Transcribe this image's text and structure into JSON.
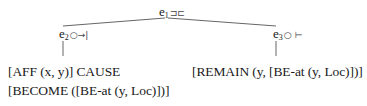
{
  "diagram": {
    "type": "event-structure-tree",
    "root": {
      "label": "e",
      "index": "1",
      "symbol": "⊐⊏",
      "symbol_name": "overlap-icon"
    },
    "children": [
      {
        "label": "e",
        "index": "2",
        "symbol": "○→|",
        "symbol_name": "bounded-process-icon",
        "formula_lines": [
          "[AFF (x, y)] CAUSE",
          "[BECOME ([BE-at (y, Loc)])]"
        ]
      },
      {
        "label": "e",
        "index": "3",
        "symbol": "○ ⊢",
        "symbol_name": "onset-state-icon",
        "formula_lines": [
          "[REMAIN (y, [BE-at (y, Loc)])]"
        ]
      }
    ],
    "colors": {
      "text": "#1a1a1a",
      "lines": "#555555",
      "background": "#ffffff"
    }
  }
}
